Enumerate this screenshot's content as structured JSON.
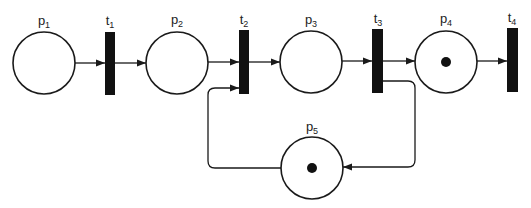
{
  "diagram": {
    "type": "petri-net",
    "colors": {
      "stroke": "#1a1a1a",
      "transition_fill": "#111111",
      "token": "#111111",
      "background": "#ffffff"
    },
    "places": [
      {
        "id": "p1",
        "base": "p",
        "sub": "1",
        "cx": 44,
        "cy": 63,
        "tokens": 0
      },
      {
        "id": "p2",
        "base": "p",
        "sub": "2",
        "cx": 177,
        "cy": 63,
        "tokens": 0
      },
      {
        "id": "p3",
        "base": "p",
        "sub": "3",
        "cx": 311,
        "cy": 62,
        "tokens": 0
      },
      {
        "id": "p4",
        "base": "p",
        "sub": "4",
        "cx": 446,
        "cy": 62,
        "tokens": 1
      },
      {
        "id": "p5",
        "base": "p",
        "sub": "5",
        "cx": 312,
        "cy": 168,
        "tokens": 1
      }
    ],
    "transitions": [
      {
        "id": "t1",
        "base": "t",
        "sub": "1",
        "x": 105,
        "y": 32,
        "w": 10,
        "h": 63
      },
      {
        "id": "t2",
        "base": "t",
        "sub": "2",
        "x": 239,
        "y": 30,
        "w": 10,
        "h": 64
      },
      {
        "id": "t3",
        "base": "t",
        "sub": "3",
        "x": 372,
        "y": 29,
        "w": 11,
        "h": 64
      },
      {
        "id": "t4",
        "base": "t",
        "sub": "4",
        "x": 507,
        "y": 28,
        "w": 11,
        "h": 64
      }
    ],
    "arcs": [
      {
        "from": "p1",
        "to": "t1"
      },
      {
        "from": "t1",
        "to": "p2"
      },
      {
        "from": "p2",
        "to": "t2"
      },
      {
        "from": "t2",
        "to": "p3"
      },
      {
        "from": "p3",
        "to": "t3"
      },
      {
        "from": "t3",
        "to": "p4"
      },
      {
        "from": "p4",
        "to": "t4"
      },
      {
        "from": "t3",
        "to": "p5"
      },
      {
        "from": "p5",
        "to": "t2"
      }
    ],
    "labels": {
      "p1": {
        "base": "p",
        "sub": "1"
      },
      "p2": {
        "base": "p",
        "sub": "2"
      },
      "p3": {
        "base": "p",
        "sub": "3"
      },
      "p4": {
        "base": "p",
        "sub": "4"
      },
      "p5": {
        "base": "p",
        "sub": "5"
      },
      "t1": {
        "base": "t",
        "sub": "1"
      },
      "t2": {
        "base": "t",
        "sub": "2"
      },
      "t3": {
        "base": "t",
        "sub": "3"
      },
      "t4": {
        "base": "t",
        "sub": "4"
      }
    }
  }
}
